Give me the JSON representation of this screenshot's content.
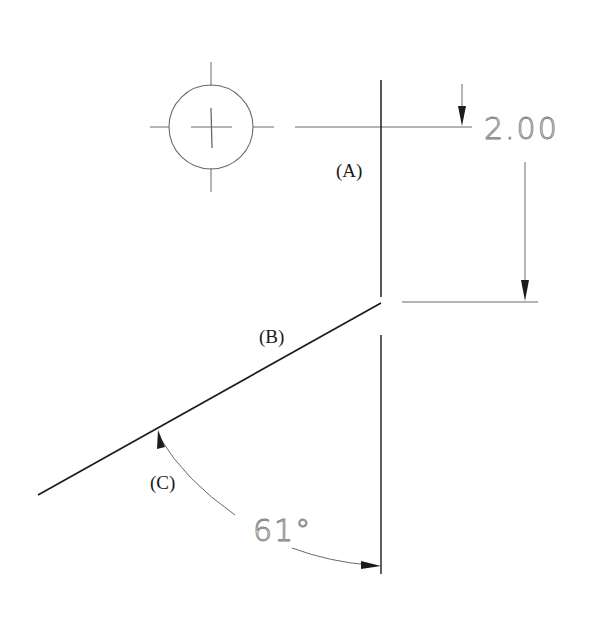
{
  "drawing": {
    "labels": {
      "a": "(A)",
      "b": "(B)",
      "c": "(C)"
    },
    "dimensions": {
      "linear": "2.00",
      "angle": "61°"
    },
    "symbols": {
      "center_mark": "circle-with-centerline-cross"
    },
    "colors": {
      "background": "#ffffff",
      "object_line": "#1c1c1c",
      "dimension_text": "#808080",
      "thin_line": "#6a6a6a"
    }
  }
}
